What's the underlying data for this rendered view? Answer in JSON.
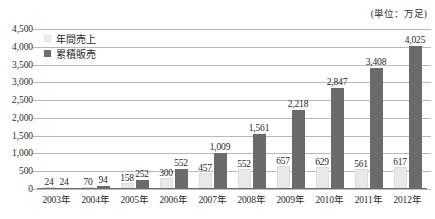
{
  "unit_note": "(単位：万足)",
  "legend": {
    "position": "top-left",
    "items": [
      {
        "label": "年間売上",
        "color": "#e9e9e9",
        "swatch": "annual"
      },
      {
        "label": "累積販売",
        "color": "#6b6b6b",
        "swatch": "cumulative"
      }
    ]
  },
  "chart_data": {
    "type": "bar",
    "title": "",
    "subtitle": "",
    "xlabel": "",
    "ylabel": "",
    "unit": "(単位：万足)",
    "ylim": [
      0,
      4500
    ],
    "ytick_step": 500,
    "grid": true,
    "legend_position": "top-left",
    "categories": [
      "2003年",
      "2004年",
      "2005年",
      "2006年",
      "2007年",
      "2008年",
      "2009年",
      "2010年",
      "2011年",
      "2012年"
    ],
    "ytick_labels": [
      "4,500",
      "4,000",
      "3,500",
      "3,000",
      "2,500",
      "2,000",
      "1,500",
      "1,000",
      "500",
      "0"
    ],
    "ytick_values": [
      4500,
      4000,
      3500,
      3000,
      2500,
      2000,
      1500,
      1000,
      500,
      0
    ],
    "series": [
      {
        "name": "年間売上",
        "color": "#e9e9e9",
        "values": [
          24,
          70,
          158,
          300,
          457,
          552,
          657,
          629,
          561,
          617
        ],
        "labels": [
          "24",
          "70",
          "158",
          "300",
          "457",
          "552",
          "657",
          "629",
          "561",
          "617"
        ]
      },
      {
        "name": "累積販売",
        "color": "#6b6b6b",
        "values": [
          24,
          94,
          252,
          552,
          1009,
          1561,
          2218,
          2847,
          3408,
          4025
        ],
        "labels": [
          "24",
          "94",
          "252",
          "552",
          "1,009",
          "1,561",
          "2,218",
          "2,847",
          "3,408",
          "4,025"
        ]
      }
    ]
  }
}
